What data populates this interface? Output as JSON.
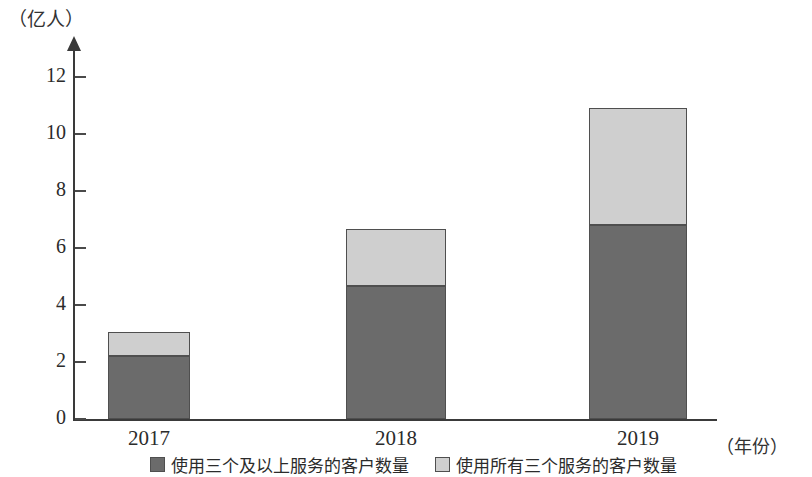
{
  "chart_data": {
    "type": "bar",
    "subtype": "stacked-bar",
    "title": "",
    "xlabel": "（年份）",
    "ylabel": "（亿人）",
    "categories": [
      "2017",
      "2018",
      "2019"
    ],
    "series": [
      {
        "name": "使用三个及以上服务的客户数量",
        "color": "#6b6b6b",
        "values": [
          2.2,
          4.65,
          6.8
        ]
      },
      {
        "name": "使用所有三个服务的客户数量",
        "color": "#cfcfcf",
        "values": [
          0.85,
          2.0,
          4.1
        ]
      }
    ],
    "totals": [
      3.05,
      6.65,
      10.9
    ],
    "ylim": [
      0,
      13
    ],
    "yticks": [
      0,
      2,
      4,
      6,
      8,
      10,
      12
    ],
    "ytick_labels": [
      "0",
      "2",
      "4",
      "6",
      "8",
      "10",
      "12"
    ],
    "grid": false,
    "legend_position": "bottom"
  },
  "axes": {
    "y_title": "（亿人）",
    "x_title": "（年份）"
  },
  "legend": {
    "items": [
      {
        "label": "使用三个及以上服务的客户数量",
        "color": "#6b6b6b"
      },
      {
        "label": "使用所有三个服务的客户数量",
        "color": "#cfcfcf"
      }
    ]
  },
  "colors": {
    "lower_segment": "#6b6b6b",
    "upper_segment": "#cfcfcf",
    "axis": "#3a3a3a",
    "background": "#ffffff"
  }
}
